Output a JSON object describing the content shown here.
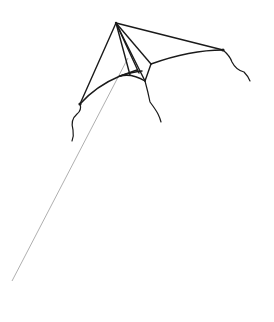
{
  "image": {
    "subject": "Line drawing of a delta kite with string and tails",
    "background": "#ffffff",
    "stroke_color": "#1a1a1a",
    "string_color": "#9a9a9a"
  },
  "kite": {
    "apex": [
      116,
      23
    ],
    "left_tip": [
      80,
      106
    ],
    "right_tip": [
      223,
      51
    ],
    "keel_point": [
      146,
      80
    ]
  },
  "string": {
    "start": [
      128,
      60
    ],
    "end": [
      12,
      281
    ]
  }
}
